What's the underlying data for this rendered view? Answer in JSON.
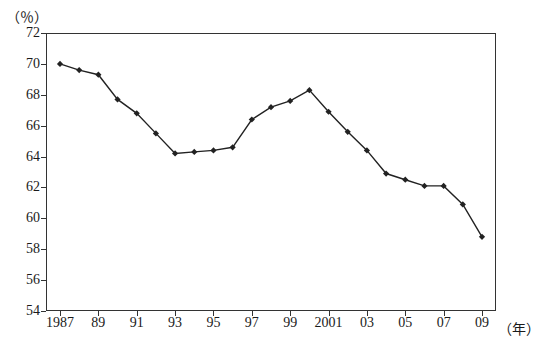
{
  "chart_data": {
    "type": "line",
    "title": "",
    "subtitle": "",
    "xlabel": "（年）",
    "ylabel": "（％）",
    "ylim": [
      54,
      72
    ],
    "xlim": [
      1987,
      2009
    ],
    "grid": false,
    "legend": null,
    "y_ticks": [
      54,
      56,
      58,
      60,
      62,
      64,
      66,
      68,
      70,
      72
    ],
    "x_ticks": [
      {
        "value": 1987,
        "label": "1987"
      },
      {
        "value": 1989,
        "label": "89"
      },
      {
        "value": 1991,
        "label": "91"
      },
      {
        "value": 1993,
        "label": "93"
      },
      {
        "value": 1995,
        "label": "95"
      },
      {
        "value": 1997,
        "label": "97"
      },
      {
        "value": 1999,
        "label": "99"
      },
      {
        "value": 2001,
        "label": "2001"
      },
      {
        "value": 2003,
        "label": "03"
      },
      {
        "value": 2005,
        "label": "05"
      },
      {
        "value": 2007,
        "label": "07"
      },
      {
        "value": 2009,
        "label": "09"
      }
    ],
    "x": [
      1987,
      1988,
      1989,
      1990,
      1991,
      1992,
      1993,
      1994,
      1995,
      1996,
      1997,
      1998,
      1999,
      2000,
      2001,
      2002,
      2003,
      2004,
      2005,
      2006,
      2007,
      2008,
      2009
    ],
    "series": [
      {
        "name": "",
        "color": "#222222",
        "marker": "diamond",
        "values": [
          70.0,
          69.6,
          69.3,
          67.7,
          66.8,
          65.5,
          64.2,
          64.3,
          64.4,
          64.6,
          66.4,
          67.2,
          67.6,
          68.3,
          66.9,
          65.6,
          64.4,
          62.9,
          62.5,
          62.1,
          62.1,
          60.9,
          58.8
        ]
      }
    ]
  }
}
